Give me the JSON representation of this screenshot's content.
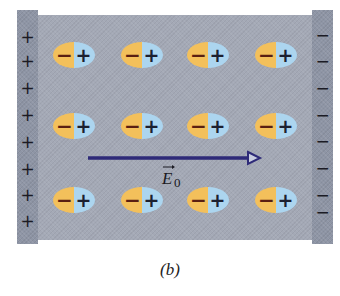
{
  "figure": {
    "caption": "(b)",
    "colors": {
      "dielectric": "#a4a9b6",
      "plate": "#8e95a5",
      "molecule_negative_half": "#f3c05b",
      "molecule_positive_half": "#acd5ef",
      "field_arrow": "#2e2a78",
      "negative_sign": "#5a1f12",
      "positive_sign": "#1c2030"
    }
  },
  "left_plate": {
    "sign": "positive",
    "charges": [
      "+",
      "+",
      "+",
      "+",
      "+",
      "+",
      "+",
      "+"
    ]
  },
  "right_plate": {
    "sign": "negative",
    "charges": [
      "−",
      "−",
      "−",
      "−",
      "−",
      "−",
      "−",
      "−"
    ]
  },
  "molecules": {
    "rows": 3,
    "columns": 4,
    "negative_label": "−",
    "positive_label": "+",
    "orientation": "negative end left, positive end right"
  },
  "field": {
    "symbol": "E",
    "subscript": "0",
    "vector_mark": "→",
    "direction": "left-to-right"
  }
}
